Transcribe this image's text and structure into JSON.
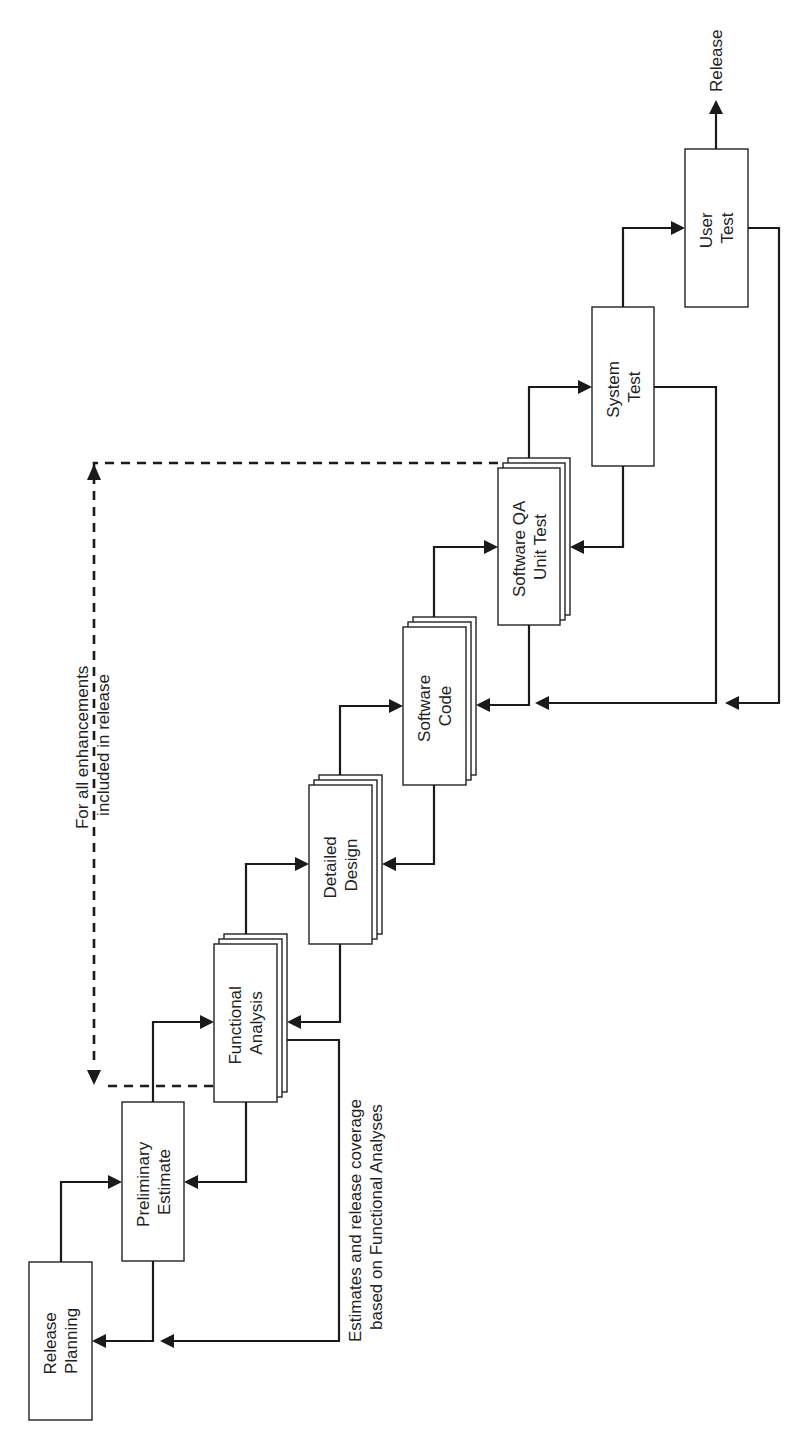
{
  "diagram": {
    "orientation": "rotated-90-ccw",
    "stages": [
      {
        "id": "release-planning",
        "line1": "Release",
        "line2": "Planning",
        "stacked": false
      },
      {
        "id": "preliminary-estimate",
        "line1": "Preliminary",
        "line2": "Estimate",
        "stacked": false
      },
      {
        "id": "functional-analysis",
        "line1": "Functional",
        "line2": "Analysis",
        "stacked": true
      },
      {
        "id": "detailed-design",
        "line1": "Detailed",
        "line2": "Design",
        "stacked": true
      },
      {
        "id": "software-code",
        "line1": "Software",
        "line2": "Code",
        "stacked": true
      },
      {
        "id": "software-qa-unit-test",
        "line1": "Software QA",
        "line2": "Unit Test",
        "stacked": true
      },
      {
        "id": "system-test",
        "line1": "System",
        "line2": "Test",
        "stacked": false
      },
      {
        "id": "user-test",
        "line1": "User",
        "line2": "Test",
        "stacked": false
      }
    ],
    "output_label": "Release",
    "annotations": {
      "enhancements_line1": "For all enhancements",
      "enhancements_line2": "included in release",
      "estimates_line1": "Estimates and release coverage",
      "estimates_line2": "based on Functional Analyses"
    },
    "colors": {
      "stroke": "#1a1a1a",
      "background": "#ffffff"
    }
  }
}
